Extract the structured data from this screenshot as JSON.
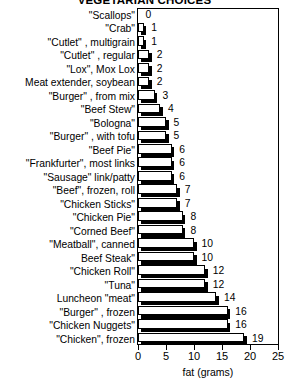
{
  "chart_data": {
    "type": "bar",
    "orientation": "horizontal",
    "title": "VEGETARIAN CHOICES",
    "xlabel": "fat (grams)",
    "ylabel": "",
    "xlim": [
      0,
      25
    ],
    "xticks": [
      0,
      5,
      10,
      15,
      20,
      25
    ],
    "grid": false,
    "legend": null,
    "categories": [
      "\"Scallops\"",
      "\"Crab\"",
      "\"Cutlet\" , multigrain",
      "\"Cutlet\" , regular",
      "\"Lox\", Mox Lox",
      "Meat extender, soybean",
      "\"Burger\" , from mix",
      "\"Beef Stew\"",
      "\"Bologna\"",
      "\"Burger\" , with tofu",
      "\"Beef Pie\"",
      "\"Frankfurter\", most links",
      "\"Sausage\" link/patty",
      "\"Beef\", frozen, roll",
      "\"Chicken Sticks\"",
      "\"Chicken Pie\"",
      "\"Corned Beef\"",
      "\"Meatball\", canned",
      "Beef Steak\"",
      "\"Chicken Roll\"",
      "\"Tuna\"",
      "Luncheon \"meat\"",
      "\"Burger\" , frozen",
      "\"Chicken Nuggets\"",
      "\"Chicken\", frozen"
    ],
    "values": [
      0,
      1,
      1,
      2,
      2,
      2,
      3,
      4,
      5,
      5,
      6,
      6,
      6,
      7,
      7,
      8,
      8,
      10,
      10,
      12,
      12,
      14,
      16,
      16,
      19
    ],
    "value_labels": [
      "0",
      "1",
      "1",
      "2",
      "2",
      "2",
      "3",
      "4",
      "5",
      "5",
      "6",
      "6",
      "6",
      "7",
      "7",
      "8",
      "8",
      "10",
      "10",
      "12",
      "12",
      "14",
      "16",
      "16",
      "19"
    ]
  },
  "colors": {
    "bar_fill": "#ffffff",
    "bar_outline": "#000000",
    "bar_shadow": "#000000",
    "axis": "#000000",
    "background": "#ffffff",
    "text": "#000000"
  }
}
